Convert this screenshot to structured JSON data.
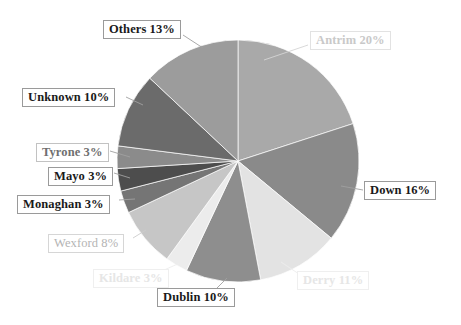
{
  "chart_data": {
    "type": "pie",
    "title": "",
    "subtitle": "",
    "xlabel": "",
    "ylabel": "",
    "legend_position": "none",
    "grid": false,
    "start_angle_deg": 0,
    "direction": "clockwise",
    "total_percent": 100,
    "categories": [
      "Antrim",
      "Down",
      "Derry",
      "Dublin",
      "Kildare",
      "Wexford",
      "Monaghan",
      "Mayo",
      "Tyrone",
      "Unknown",
      "Others"
    ],
    "values": [
      20,
      16,
      11,
      10,
      3,
      8,
      3,
      3,
      3,
      10,
      13
    ],
    "slices": [
      {
        "name": "Antrim",
        "value": 20,
        "label": "Antrim 20%",
        "color": "#a9a9a9",
        "label_style": "faint",
        "label_left": 310,
        "label_top": 31,
        "leader": [
          [
            308,
            45
          ],
          [
            264,
            60
          ]
        ]
      },
      {
        "name": "Down",
        "value": 16,
        "label": "Down 16%",
        "color": "#8a8a8a",
        "label_style": "strong",
        "label_left": 364,
        "label_top": 181,
        "leader": [
          [
            363,
            190
          ],
          [
            341,
            186
          ]
        ]
      },
      {
        "name": "Derry",
        "value": 11,
        "label": "Derry 11%",
        "color": "#e3e3e3",
        "label_style": "ghost",
        "label_left": 297,
        "label_top": 271,
        "leader": [
          [
            299,
            274
          ],
          [
            281,
            262
          ]
        ]
      },
      {
        "name": "Dublin",
        "value": 10,
        "label": "Dublin 10%",
        "color": "#8e8e8e",
        "label_style": "strong",
        "label_left": 157,
        "label_top": 288,
        "leader": [
          [
            215,
            290
          ],
          [
            227,
            278
          ]
        ]
      },
      {
        "name": "Kildare",
        "value": 3,
        "label": "Kildare 3%",
        "color": "#ececec",
        "label_style": "ghost",
        "label_left": 93,
        "label_top": 269,
        "leader": [
          [
            164,
            270
          ],
          [
            180,
            263
          ]
        ]
      },
      {
        "name": "Wexford",
        "value": 8,
        "label": "Wexford 8%",
        "color": "#c6c6c6",
        "label_style": "light",
        "label_left": 48,
        "label_top": 234,
        "leader": [
          [
            133,
            238
          ],
          [
            146,
            230
          ]
        ]
      },
      {
        "name": "Monaghan",
        "value": 3,
        "label": "Monaghan 3%",
        "color": "#757575",
        "label_style": "strong",
        "label_left": 17,
        "label_top": 195,
        "leader": [
          [
            119,
            200
          ],
          [
            135,
            199
          ]
        ]
      },
      {
        "name": "Mayo",
        "value": 3,
        "label": "Mayo 3%",
        "color": "#4d4d4d",
        "label_style": "strong",
        "label_left": 48,
        "label_top": 167,
        "leader": [
          [
            114,
            173
          ],
          [
            130,
            178
          ]
        ]
      },
      {
        "name": "Tyrone",
        "value": 3,
        "label": "Tyrone 3%",
        "color": "#8b8b8b",
        "label_style": "mid",
        "label_left": 36,
        "label_top": 143,
        "leader": [
          [
            110,
            151
          ],
          [
            130,
            157
          ]
        ]
      },
      {
        "name": "Unknown",
        "value": 10,
        "label": "Unknown 10%",
        "color": "#6b6b6b",
        "label_style": "strong",
        "label_left": 22,
        "label_top": 88,
        "leader": [
          [
            126,
            97
          ],
          [
            143,
            105
          ]
        ]
      },
      {
        "name": "Others",
        "value": 13,
        "label": "Others 13%",
        "color": "#9c9c9c",
        "label_style": "strong",
        "label_left": 103,
        "label_top": 20,
        "leader": [
          [
            183,
            35
          ],
          [
            203,
            48
          ]
        ]
      }
    ],
    "geometry": {
      "center_x": 238,
      "center_y": 161,
      "radius": 121
    },
    "background_color": "#ffffff"
  }
}
